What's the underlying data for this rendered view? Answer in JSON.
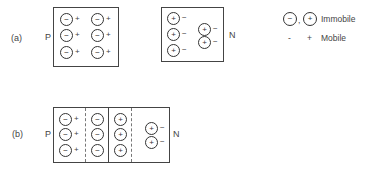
{
  "figure_a": {
    "label": "(a)",
    "p_label": "P",
    "n_label": "N",
    "p_region": {
      "immobile_sign": "−",
      "mobile_sign": "+",
      "count": 6
    },
    "n_region": {
      "immobile_sign": "+",
      "mobile_sign": "−",
      "count": 5
    }
  },
  "figure_b": {
    "label": "(b)",
    "p_label": "P",
    "n_label": "N",
    "regions": [
      {
        "name": "p-neutral",
        "immobile_sign": "−",
        "mobile_sign": "+",
        "count": 3
      },
      {
        "name": "p-depletion",
        "immobile_sign": "−",
        "mobile_sign": "",
        "count": 3
      },
      {
        "name": "n-depletion",
        "immobile_sign": "+",
        "mobile_sign": "",
        "count": 3
      },
      {
        "name": "n-neutral",
        "immobile_sign": "+",
        "mobile_sign": "−",
        "count": 2
      }
    ]
  },
  "legend": {
    "immobile_neg": "−",
    "separator": ",",
    "immobile_pos": "+",
    "immobile_label": "Immobile",
    "mobile_neg": "-",
    "mobile_pos": "+",
    "mobile_label": "Mobile"
  }
}
